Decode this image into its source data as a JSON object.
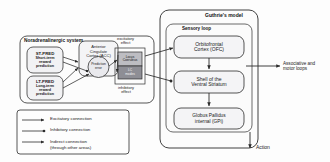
{
  "diagram": {
    "panels": [
      {
        "id": "noradrenergic-system",
        "label": "Noradrenalinergic system"
      },
      {
        "id": "guthries-model",
        "label": "Guthrie's model"
      }
    ],
    "subsections": [
      {
        "id": "sensory-loop",
        "label": "Sensory loop"
      }
    ],
    "nodes": [
      {
        "id": "st-pred",
        "title": "ST-PRED",
        "subtitle": "Short-term\nreward\nprediction",
        "shape": "rounded-rect",
        "fill": "#f2f2f4"
      },
      {
        "id": "lt-pred",
        "title": "LT-PRED",
        "subtitle": "Long-term\nreward\nprediction",
        "shape": "rounded-rect",
        "fill": "#f2f2f4"
      },
      {
        "id": "acc",
        "title": "Anterior\nCingulate\nCortex (ACC)",
        "subtitle": "",
        "shape": "rounded-rect",
        "fill": "#f2f2f4"
      },
      {
        "id": "prediction-error",
        "title": "Prediction\nerror",
        "subtitle": "",
        "shape": "circle",
        "fill": "#e6e6ea"
      },
      {
        "id": "locus-coeruleus",
        "title": "Locus\nCoeruleus",
        "subtitle": "",
        "shape": "rect",
        "fill": "#bdbdc2"
      },
      {
        "id": "lc-mode",
        "title": "LC\nmodes",
        "subtitle": "",
        "shape": "rect",
        "fill": "#8e8e95"
      },
      {
        "id": "ofc",
        "title": "Orbitofrontal\nCortex (OFC)",
        "subtitle": "",
        "shape": "rounded-rect",
        "fill": "#f2f2f4"
      },
      {
        "id": "ventral-striatum",
        "title": "Shell of the\nVentral Striatum",
        "subtitle": "",
        "shape": "rounded-rect",
        "fill": "#f2f2f4"
      },
      {
        "id": "gpi",
        "title": "Globus Pallidus\ninternal (GPi)",
        "subtitle": "",
        "shape": "rounded-rect",
        "fill": "#f2f2f4"
      }
    ],
    "annotations": [
      {
        "id": "excitatory-effect",
        "text": "excitatory\neffect"
      },
      {
        "id": "inhibitory-effect",
        "text": "inhibitory\neffect"
      },
      {
        "id": "associative-motor-loops",
        "text": "Associative and\nmotor loops"
      },
      {
        "id": "action-output",
        "text": "Action"
      }
    ],
    "legend": {
      "items": [
        {
          "id": "excitatory-connection",
          "label": "Excitatory connection",
          "marker": "arrow-head",
          "line": "solid"
        },
        {
          "id": "inhibitory-connection",
          "label": "Inhibitory connection",
          "marker": "filled-circle",
          "line": "solid"
        },
        {
          "id": "indirect-connection",
          "label": "Indirect connection\n(through other areas)",
          "marker": "arrow-head",
          "line": "solid"
        }
      ]
    },
    "colors": {
      "stroke": "#2b2b2b",
      "panel_fill": "#fafafa",
      "node_fill": "#f2f2f4",
      "dark_fill": "#8e8e95",
      "mid_fill": "#bdbdc2",
      "text": "#1a1a1a"
    }
  }
}
